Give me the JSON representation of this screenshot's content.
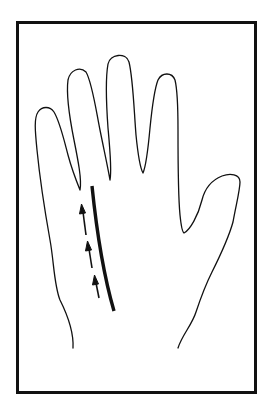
{
  "diagram": {
    "title": "Palm diagram: hand outline with a marked palm line and upward arrows",
    "elements": {
      "frame": "rectangular border frame",
      "hand_outline": "hand outline with four fingers and thumb",
      "palm_line": "bold curved line on the palm",
      "arrows": {
        "count": 3,
        "direction": "up",
        "style": "dashed with arrowheads"
      }
    },
    "colors": {
      "stroke": "#111111",
      "background": "#ffffff"
    }
  }
}
